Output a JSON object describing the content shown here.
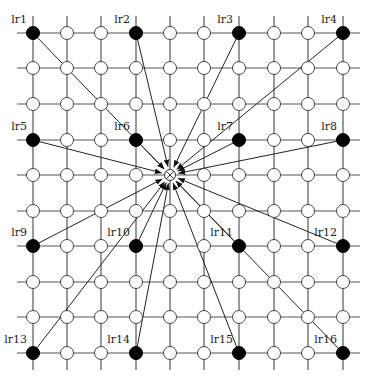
{
  "diagram": {
    "grid": {
      "columns_x": [
        33,
        67,
        101,
        136,
        170,
        204,
        239,
        274,
        308,
        343
      ],
      "rows_y": [
        33,
        68,
        104,
        140,
        175,
        211,
        246,
        282,
        317,
        353
      ],
      "line_extent": {
        "x_min": 17,
        "x_max": 360,
        "y_min": 16,
        "y_max": 370
      }
    },
    "center_node": {
      "col": 4,
      "row": 4,
      "symbol": "circle-with-x"
    },
    "filled_nodes": [
      {
        "label": "lr1",
        "col": 0,
        "row": 0
      },
      {
        "label": "lr2",
        "col": 3,
        "row": 0
      },
      {
        "label": "lr3",
        "col": 6,
        "row": 0
      },
      {
        "label": "lr4",
        "col": 9,
        "row": 0
      },
      {
        "label": "lr5",
        "col": 0,
        "row": 3
      },
      {
        "label": "lr6",
        "col": 3,
        "row": 3
      },
      {
        "label": "lr7",
        "col": 6,
        "row": 3
      },
      {
        "label": "lr8",
        "col": 9,
        "row": 3
      },
      {
        "label": "lr9",
        "col": 0,
        "row": 6
      },
      {
        "label": "lr10",
        "col": 3,
        "row": 6
      },
      {
        "label": "lr11",
        "col": 6,
        "row": 6
      },
      {
        "label": "lr12",
        "col": 9,
        "row": 6
      },
      {
        "label": "lr13",
        "col": 0,
        "row": 9
      },
      {
        "label": "lr14",
        "col": 3,
        "row": 9
      },
      {
        "label": "lr15",
        "col": 6,
        "row": 9
      },
      {
        "label": "lr16",
        "col": 9,
        "row": 9
      }
    ],
    "colors": {
      "line": "#555555",
      "filled": "#000000",
      "open": "#ffffff"
    }
  }
}
